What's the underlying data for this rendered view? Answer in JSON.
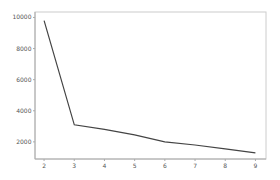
{
  "chart_data": {
    "type": "line",
    "title": "",
    "xlabel": "",
    "ylabel": "",
    "x": [
      2,
      3,
      4,
      5,
      6,
      7,
      8,
      9
    ],
    "series": [
      {
        "name": "series",
        "values": [
          9800,
          3100,
          2800,
          2450,
          2000,
          1800,
          1550,
          1300
        ],
        "color": "#444444"
      }
    ],
    "xticks": [
      2,
      3,
      4,
      5,
      6,
      7,
      8,
      9
    ],
    "yticks": [
      2000,
      4000,
      6000,
      8000,
      10000
    ],
    "xlim": [
      1.7,
      9.35
    ],
    "ylim": [
      900,
      10350
    ],
    "grid": false,
    "legend": null
  },
  "colors": {
    "line": "#444444",
    "axis": "#aaaaaa",
    "frame": "#cccccc",
    "tick_text": "#555555"
  }
}
